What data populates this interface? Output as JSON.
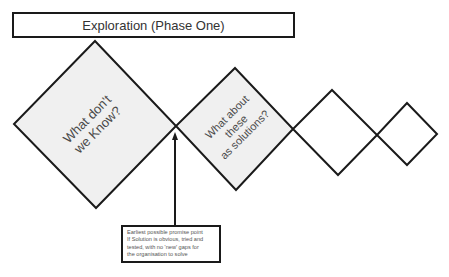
{
  "title": "Exploration (Phase One)",
  "colors": {
    "stroke": "#1a1a1a",
    "shaded_fill": "#f0f0f0",
    "plain_fill": "#ffffff",
    "text": "#4a4a4a"
  },
  "diamonds": [
    {
      "id": "diamond-1",
      "label": "What don't\nwe Know?",
      "shaded": true
    },
    {
      "id": "diamond-2",
      "label": "What about\nthese\nas solutions?",
      "shaded": true
    },
    {
      "id": "diamond-3",
      "label": "",
      "shaded": false
    },
    {
      "id": "diamond-4",
      "label": "",
      "shaded": false
    }
  ],
  "note": {
    "lines": [
      "Earliest possible promise point",
      "If Solution is obvious, tried and",
      "tested, with no 'new' gaps for",
      "the organisation to solve"
    ]
  }
}
